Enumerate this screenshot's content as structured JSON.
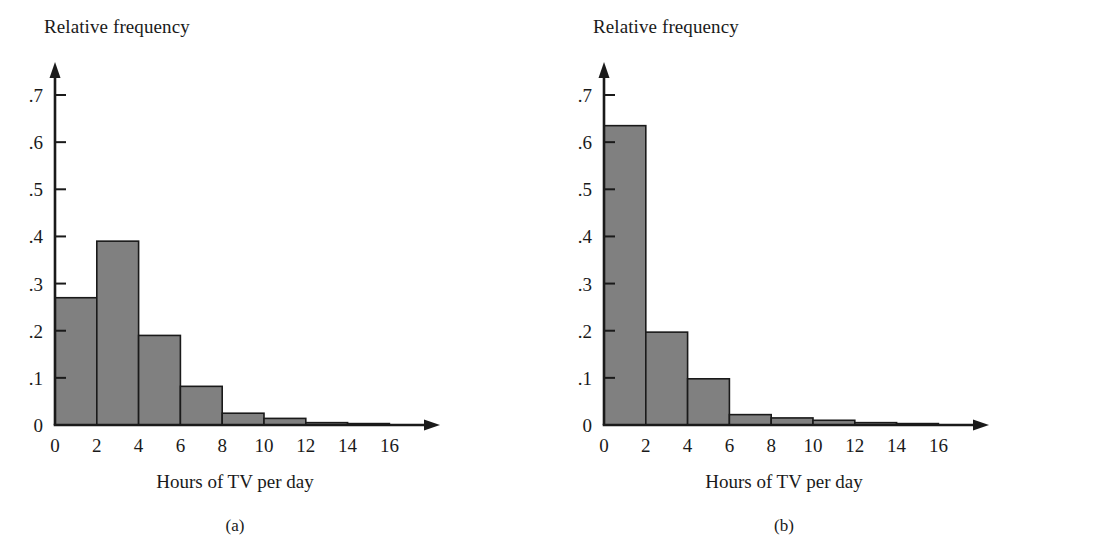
{
  "figure": {
    "panels": [
      {
        "key": "a",
        "caption": "(a)",
        "y_axis_title": "Relative frequency",
        "x_axis_title": "Hours of TV per day"
      },
      {
        "key": "b",
        "caption": "(b)",
        "y_axis_title": "Relative frequency",
        "x_axis_title": "Hours of TV per day"
      }
    ],
    "colors": {
      "bar_fill": "#808080",
      "bar_stroke": "#1a1a1a",
      "axis": "#1a1a1a",
      "background": "#ffffff"
    }
  },
  "chart_data": [
    {
      "type": "bar",
      "title": "(a)",
      "xlabel": "Hours of TV per day",
      "ylabel": "Relative frequency",
      "xlim": [
        0,
        18
      ],
      "ylim": [
        0,
        0.75
      ],
      "grid": false,
      "legend": "none",
      "bin_width": 2,
      "bin_edges": [
        0,
        2,
        4,
        6,
        8,
        10,
        12,
        14,
        16
      ],
      "categories": [
        "0-2",
        "2-4",
        "4-6",
        "6-8",
        "8-10",
        "10-12",
        "12-14",
        "14-16"
      ],
      "values": [
        0.27,
        0.39,
        0.19,
        0.082,
        0.025,
        0.014,
        0.005,
        0.003
      ],
      "xticks": [
        0,
        2,
        4,
        6,
        8,
        10,
        12,
        14,
        16
      ],
      "xtick_labels": [
        "0",
        "2",
        "4",
        "6",
        "8",
        "10",
        "12",
        "14",
        "16"
      ],
      "yticks": [
        0,
        0.1,
        0.2,
        0.3,
        0.4,
        0.5,
        0.6,
        0.7
      ],
      "ytick_labels": [
        "0",
        ".1",
        ".2",
        ".3",
        ".4",
        ".5",
        ".6",
        ".7"
      ]
    },
    {
      "type": "bar",
      "title": "(b)",
      "xlabel": "Hours of TV per day",
      "ylabel": "Relative frequency",
      "xlim": [
        0,
        18
      ],
      "ylim": [
        0,
        0.75
      ],
      "grid": false,
      "legend": "none",
      "bin_width": 2,
      "bin_edges": [
        0,
        2,
        4,
        6,
        8,
        10,
        12,
        14,
        16
      ],
      "categories": [
        "0-2",
        "2-4",
        "4-6",
        "6-8",
        "8-10",
        "10-12",
        "12-14",
        "14-16"
      ],
      "values": [
        0.635,
        0.197,
        0.098,
        0.022,
        0.015,
        0.01,
        0.005,
        0.003
      ],
      "xticks": [
        0,
        2,
        4,
        6,
        8,
        10,
        12,
        14,
        16
      ],
      "xtick_labels": [
        "0",
        "2",
        "4",
        "6",
        "8",
        "10",
        "12",
        "14",
        "16"
      ],
      "yticks": [
        0,
        0.1,
        0.2,
        0.3,
        0.4,
        0.5,
        0.6,
        0.7
      ],
      "ytick_labels": [
        "0",
        ".1",
        ".2",
        ".3",
        ".4",
        ".5",
        ".6",
        ".7"
      ]
    }
  ]
}
